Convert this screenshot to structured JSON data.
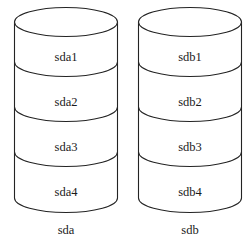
{
  "diagram": {
    "type": "disk-partition-cylinders",
    "background_color": "#ffffff",
    "line_color": "#232323",
    "text_color": "#1a1a1a",
    "disks": [
      {
        "name": "sda",
        "caption": "sda",
        "partitions": [
          {
            "label": "sda1"
          },
          {
            "label": "sda2"
          },
          {
            "label": "sda3"
          },
          {
            "label": "sda4"
          }
        ]
      },
      {
        "name": "sdb",
        "caption": "sdb",
        "partitions": [
          {
            "label": "sdb1"
          },
          {
            "label": "sdb2"
          },
          {
            "label": "sdb3"
          },
          {
            "label": "sdb4"
          }
        ]
      }
    ]
  }
}
